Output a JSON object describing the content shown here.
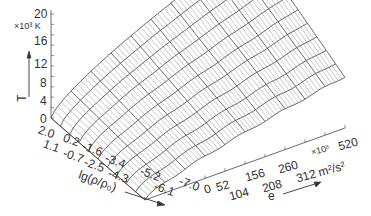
{
  "chart_data": {
    "type": "surface3d",
    "title": "",
    "zlabel": "T",
    "zunit": "×10³ K",
    "zticks": [
      "0",
      "4",
      "8",
      "12",
      "16",
      "20"
    ],
    "zlim": [
      0,
      20
    ],
    "xlabel": "lg(ρ/ρ₀)",
    "xticks": [
      "2.0",
      "1.1",
      "0.2",
      "-0.7",
      "-1.6",
      "-2.5",
      "-3.4",
      "-4.3",
      "-5.2",
      "-6.1",
      "-7.0"
    ],
    "xlim": [
      2.0,
      -7.0
    ],
    "ylabel": "e",
    "yunit": "×10⁵ m²/s²",
    "yticks": [
      "0",
      "52",
      "104",
      "156",
      "208",
      "260",
      "312",
      "520"
    ],
    "ylim": [
      0,
      520
    ],
    "grid": false,
    "legend": null
  },
  "labels": {
    "z_axis_name": "T",
    "z_unit": "×10³ K",
    "x_axis_name": "lg(ρ/ρ₀)",
    "y_axis_name": "e",
    "y_unit_prefix": "×10⁵",
    "y_unit": "m²/s²"
  }
}
